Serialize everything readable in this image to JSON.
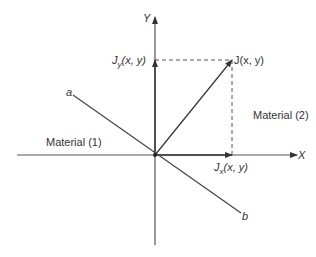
{
  "axes": {
    "x_label": "X",
    "y_label": "Y"
  },
  "vector": {
    "label": "J(x, y)",
    "x_component": {
      "symbol": "J",
      "subscript": "x",
      "args": "(x, y)"
    },
    "y_component": {
      "symbol": "J",
      "subscript": "y",
      "args": "(x, y)"
    }
  },
  "boundary": {
    "end_a": "a",
    "end_b": "b"
  },
  "regions": {
    "material_1": "Material (1)",
    "material_2": "Material (2)"
  },
  "colors": {
    "line": "#444444",
    "text": "#333333",
    "background": "#ffffff"
  }
}
